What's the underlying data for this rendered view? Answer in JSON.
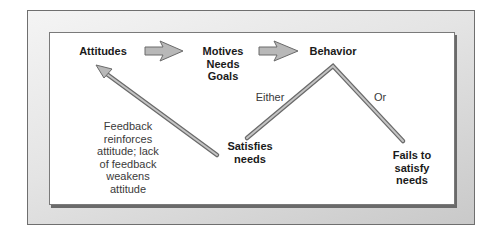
{
  "diagram": {
    "nodes": {
      "attitudes": "Attitudes",
      "motives": [
        "Motives",
        "Needs",
        "Goals"
      ],
      "behavior": "Behavior",
      "satisfies": [
        "Satisfies",
        "needs"
      ],
      "fails": [
        "Fails to",
        "satisfy",
        "needs"
      ]
    },
    "branch_labels": {
      "either": "Either",
      "or": "Or"
    },
    "feedback_note": [
      "Feedback",
      "reinforces",
      "attitude; lack",
      "of feedback",
      "weakens",
      "attitude"
    ],
    "edges": [
      {
        "from": "attitudes",
        "to": "motives",
        "type": "block-arrow"
      },
      {
        "from": "motives",
        "to": "behavior",
        "type": "block-arrow"
      },
      {
        "from": "behavior",
        "to": "satisfies",
        "label": "Either",
        "type": "line"
      },
      {
        "from": "behavior",
        "to": "fails",
        "label": "Or",
        "type": "line"
      },
      {
        "from": "satisfies",
        "to": "attitudes",
        "type": "arrow"
      }
    ],
    "colors": {
      "arrow_fill": "#b8b8b8",
      "arrow_stroke": "#6a6a6a",
      "frame_shadow": "#6a6a6a"
    }
  }
}
